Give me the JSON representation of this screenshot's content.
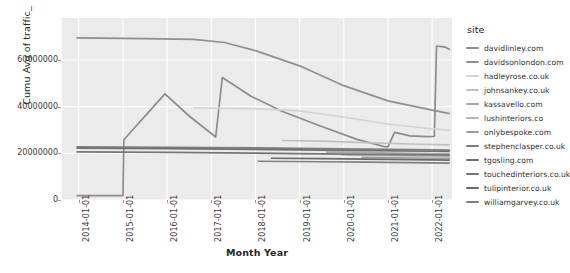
{
  "chart_data": {
    "type": "line",
    "title": "",
    "xlabel": "Month Year",
    "ylabel": "Cumu Avg of traffic_",
    "grid": true,
    "legend_position": "right",
    "legend_title": "site",
    "x_tick_labels": [
      "2014-01-01",
      "2015-01-01",
      "2016-01-01",
      "2017-01-01",
      "2018-01-01",
      "2019-01-01",
      "2020-01-01",
      "2021-01-01",
      "2022-01-01"
    ],
    "y_tick_labels": [
      "0",
      "20000000",
      "40000000",
      "60000000"
    ],
    "y_tick_values": [
      0,
      20000000,
      40000000,
      60000000
    ],
    "ylim": [
      0,
      78000000
    ],
    "xlim": [
      "2013-08-01",
      "2022-06-01"
    ],
    "series": [
      {
        "name": "davidlinley.com",
        "color": "#8c8c8c",
        "points": [
          [
            2013.95,
            1900000
          ],
          [
            2015.0,
            1900000
          ],
          [
            2015.02,
            25800000
          ],
          [
            2015.95,
            45500000
          ],
          [
            2016.5,
            36000000
          ],
          [
            2017.0,
            28500000
          ],
          [
            2017.1,
            27000000
          ],
          [
            2017.25,
            52500000
          ],
          [
            2017.9,
            44500000
          ],
          [
            2018.6,
            38000000
          ],
          [
            2019.5,
            31500000
          ],
          [
            2020.3,
            26000000
          ],
          [
            2020.9,
            23000000
          ],
          [
            2021.0,
            22800000
          ],
          [
            2021.15,
            29000000
          ],
          [
            2021.5,
            27500000
          ],
          [
            2021.9,
            27200000
          ],
          [
            2022.05,
            27300000
          ],
          [
            2022.1,
            66000000
          ],
          [
            2022.3,
            65500000
          ],
          [
            2022.4,
            64500000
          ]
        ]
      },
      {
        "name": "davidsonlondon.com",
        "color": "#8f8f8f",
        "points": [
          [
            2013.95,
            69500000
          ],
          [
            2015.5,
            69200000
          ],
          [
            2016.6,
            68800000
          ],
          [
            2017.3,
            67500000
          ],
          [
            2018.0,
            64000000
          ],
          [
            2019.0,
            57500000
          ],
          [
            2020.0,
            49000000
          ],
          [
            2021.0,
            42500000
          ],
          [
            2022.0,
            38500000
          ],
          [
            2022.4,
            37000000
          ]
        ]
      },
      {
        "name": "hadleyrose.co.uk",
        "color": "#d4d4d4",
        "points": [
          [
            2016.6,
            39500000
          ],
          [
            2018.0,
            39200000
          ],
          [
            2019.0,
            38200000
          ],
          [
            2020.0,
            35500000
          ],
          [
            2021.0,
            32500000
          ],
          [
            2022.0,
            30500000
          ],
          [
            2022.4,
            29800000
          ]
        ]
      },
      {
        "name": "johnsankey.co.uk",
        "color": "#c0c0c0",
        "points": [
          [
            2018.6,
            25500000
          ],
          [
            2019.5,
            25200000
          ],
          [
            2020.5,
            24600000
          ],
          [
            2021.5,
            24000000
          ],
          [
            2022.4,
            23600000
          ]
        ]
      },
      {
        "name": "kassavello.com",
        "color": "#a8a8a8",
        "points": [
          [
            2019.6,
            20500000
          ],
          [
            2020.5,
            20300000
          ],
          [
            2021.5,
            20000000
          ],
          [
            2022.4,
            19800000
          ]
        ]
      },
      {
        "name": "lushinteriors.co",
        "color": "#b4b4b4",
        "points": [
          [
            2019.95,
            19300000
          ],
          [
            2020.8,
            19100000
          ],
          [
            2021.6,
            18900000
          ],
          [
            2022.4,
            18700000
          ]
        ]
      },
      {
        "name": "onlybespoke.com",
        "color": "#9e9e9e",
        "points": [
          [
            2020.4,
            18300000
          ],
          [
            2021.2,
            18100000
          ],
          [
            2022.0,
            17900000
          ],
          [
            2022.4,
            17800000
          ]
        ]
      },
      {
        "name": "stephenclasper.co.uk",
        "color": "#7d7d7d",
        "points": [
          [
            2013.95,
            22800000
          ],
          [
            2016.0,
            22600000
          ],
          [
            2018.0,
            22300000
          ],
          [
            2020.0,
            21900000
          ],
          [
            2022.0,
            21500000
          ],
          [
            2022.4,
            21400000
          ]
        ]
      },
      {
        "name": "tgosling.com",
        "color": "#6f6f6f",
        "points": [
          [
            2013.95,
            22200000
          ],
          [
            2016.0,
            22000000
          ],
          [
            2018.0,
            21700000
          ],
          [
            2020.0,
            21300000
          ],
          [
            2022.0,
            20900000
          ],
          [
            2022.4,
            20800000
          ]
        ]
      },
      {
        "name": "touchedinteriors.co.uk",
        "color": "#757575",
        "points": [
          [
            2013.95,
            20600000
          ],
          [
            2016.0,
            20400000
          ],
          [
            2018.0,
            20100000
          ],
          [
            2020.0,
            19700000
          ],
          [
            2022.0,
            19300000
          ],
          [
            2022.4,
            19200000
          ]
        ]
      },
      {
        "name": "tulipinterior.co.uk",
        "color": "#6a6a6a",
        "points": [
          [
            2018.35,
            17900000
          ],
          [
            2019.5,
            17700000
          ],
          [
            2020.5,
            17500000
          ],
          [
            2021.5,
            17300000
          ],
          [
            2022.4,
            17100000
          ]
        ]
      },
      {
        "name": "williamgarvey.co.uk",
        "color": "#808080",
        "points": [
          [
            2018.05,
            16600000
          ],
          [
            2019.5,
            16400000
          ],
          [
            2020.5,
            16200000
          ],
          [
            2021.5,
            16000000
          ],
          [
            2022.4,
            15800000
          ]
        ]
      }
    ]
  }
}
